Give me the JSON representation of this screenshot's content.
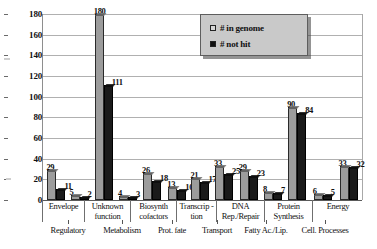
{
  "chart_data": {
    "type": "bar",
    "title": "",
    "xlabel": "",
    "ylabel": "",
    "ylim": [
      0,
      180
    ],
    "ytick_step": 20,
    "grid": true,
    "legend_position": "top-right",
    "yticks": [
      "180",
      "160",
      "140",
      "120",
      "100",
      "80",
      "60",
      "40",
      "20",
      "0"
    ],
    "categories": [
      "Envelope",
      "Regulatory",
      "Unknown function",
      "Metabolism",
      "Biosynth cofactors",
      "Prot. fate",
      "Transcrip - tion",
      "Transport",
      "DNA Rep./Repair",
      "Fatty Ac./Lip.",
      "Protein Synthesis",
      "Cell. Processes",
      "Energy"
    ],
    "series": [
      {
        "name": "# in genome",
        "color": "#9c9c9c",
        "values": [
          29,
          5,
          180,
          4,
          26,
          13,
          21,
          33,
          29,
          8,
          90,
          6,
          33
        ]
      },
      {
        "name": "# not hit",
        "color": "#1a1a1a",
        "values": [
          11,
          2,
          111,
          3,
          18,
          10,
          17,
          25,
          23,
          7,
          84,
          5,
          32
        ]
      }
    ]
  },
  "legend": {
    "items": [
      {
        "label": "# in genome",
        "swatch": "genome"
      },
      {
        "label": "# not hit",
        "swatch": "nothit"
      }
    ]
  },
  "xaxis": {
    "top_row": [
      {
        "label": "Envelope"
      },
      {
        "label": "Unknown function"
      },
      {
        "label": "Biosynth cofactors"
      },
      {
        "label": "Transcrip - tion"
      },
      {
        "label": "DNA Rep./Repair"
      },
      {
        "label": "Protein Synthesis"
      },
      {
        "label": "Energy"
      }
    ],
    "bottom_row": [
      {
        "label": "Regulatory"
      },
      {
        "label": "Metabolism"
      },
      {
        "label": "Prot. fate"
      },
      {
        "label": "Transport"
      },
      {
        "label": "Fatty Ac./Lip."
      },
      {
        "label": "Cell. Processes"
      }
    ]
  }
}
